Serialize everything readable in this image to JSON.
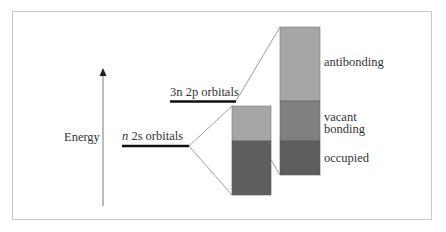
{
  "diagram": {
    "axis_label": "Energy",
    "levels": [
      {
        "id": "2s",
        "prefix": "n",
        "label": " 2s orbitals"
      },
      {
        "id": "2p",
        "prefix": "3n",
        "label": " 2p orbitals"
      }
    ],
    "bands": {
      "small": [
        {
          "name": "upper",
          "color": "#a6a6a6"
        },
        {
          "name": "lower",
          "color": "#5e5e5e"
        }
      ],
      "large": [
        {
          "name": "antibonding",
          "color": "#a6a6a6"
        },
        {
          "name": "vacant bonding",
          "color": "#808080"
        },
        {
          "name": "occupied",
          "color": "#5e5e5e"
        }
      ]
    },
    "band_labels": {
      "antibonding": "antibonding",
      "vacant": "vacant",
      "bonding": "bonding",
      "occupied": "occupied"
    }
  }
}
